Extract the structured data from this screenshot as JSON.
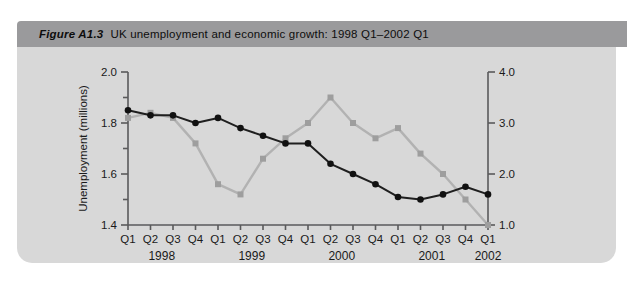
{
  "figure": {
    "label": "Figure A1.3",
    "title": "UK unemployment and economic growth: 1998 Q1–2002 Q1"
  },
  "colors": {
    "title_bar_bg": "#9a9a9c",
    "card_bg": "#d8d8d8",
    "axis": "#5a5a5c",
    "text": "#1a1a1a",
    "unemployment_line": "#1f1f1f",
    "unemployment_marker": "#111111",
    "growth_line": "#b2b2b2",
    "growth_marker": "#9e9e9e"
  },
  "chart_data": {
    "type": "line",
    "x": {
      "quarter_labels": [
        "Q1",
        "Q2",
        "Q3",
        "Q4",
        "Q1",
        "Q2",
        "Q3",
        "Q4",
        "Q1",
        "Q2",
        "Q3",
        "Q4",
        "Q1",
        "Q2",
        "Q3",
        "Q4",
        "Q1"
      ],
      "year_groups": [
        {
          "label": "1998",
          "start": 0,
          "end": 3
        },
        {
          "label": "1999",
          "start": 4,
          "end": 7
        },
        {
          "label": "2000",
          "start": 8,
          "end": 11
        },
        {
          "label": "2001",
          "start": 12,
          "end": 15
        },
        {
          "label": "2002",
          "start": 16,
          "end": 16
        }
      ]
    },
    "left_axis": {
      "label": "Unemployment (millions)",
      "min": 1.4,
      "max": 2.0,
      "major_ticks": [
        {
          "v": 1.4,
          "label": "1.4"
        },
        {
          "v": 1.6,
          "label": "1.6"
        },
        {
          "v": 1.8,
          "label": "1.8"
        },
        {
          "v": 2.0,
          "label": "2.0"
        }
      ],
      "minor_ticks": [
        1.5,
        1.7,
        1.9
      ]
    },
    "right_axis": {
      "label": "",
      "min": 1.0,
      "max": 4.0,
      "major_ticks": [
        {
          "v": 1.0,
          "label": "1.0"
        },
        {
          "v": 2.0,
          "label": "2.0"
        },
        {
          "v": 3.0,
          "label": "3.0"
        },
        {
          "v": 4.0,
          "label": "4.0"
        }
      ]
    },
    "grid": false,
    "legend": "none",
    "series": [
      {
        "name": "Economic growth (right axis, %)",
        "axis": "right",
        "marker": "square",
        "values": [
          3.1,
          3.2,
          3.1,
          2.6,
          1.8,
          1.6,
          2.3,
          2.7,
          3.0,
          3.5,
          3.0,
          2.7,
          2.9,
          2.4,
          2.0,
          1.5,
          1.0
        ]
      },
      {
        "name": "Unemployment (left axis, millions)",
        "axis": "left",
        "marker": "circle",
        "values": [
          1.85,
          1.83,
          1.83,
          1.8,
          1.82,
          1.78,
          1.75,
          1.72,
          1.72,
          1.64,
          1.6,
          1.56,
          1.51,
          1.5,
          1.52,
          1.55,
          1.52
        ]
      }
    ]
  }
}
